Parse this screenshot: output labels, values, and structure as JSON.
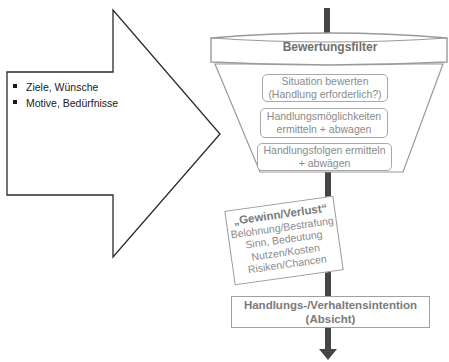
{
  "input_arrow": {
    "items": [
      "Ziele, Wünsche",
      "Motive, Bedürfnisse"
    ]
  },
  "filter": {
    "title": "Bewertungsfilter",
    "steps": [
      {
        "line1": "Situation bewerten",
        "line2": "(Handlung erforderlich?)"
      },
      {
        "line1": "Handlungsmöglichkeiten",
        "line2": "ermitteln + abwagen"
      },
      {
        "line1": "Handlungsfolgen ermitteln",
        "line2": "+ abwägen"
      }
    ]
  },
  "gain_loss": {
    "title": "„Gewinn/Verlust“",
    "lines": [
      "Belohnung/Bestrafung",
      "Sinn, Bedeutung",
      "Nutzen/Kosten",
      "Risiken/Chancen"
    ]
  },
  "intention": {
    "line1": "Handlungs-/Verhaltensintention",
    "line2": "(Absicht)"
  },
  "colors": {
    "stem": "#454545",
    "outline": "#2a2a2a",
    "funnel": "#9a9a9a",
    "text_gray": "#8a8a8a"
  }
}
